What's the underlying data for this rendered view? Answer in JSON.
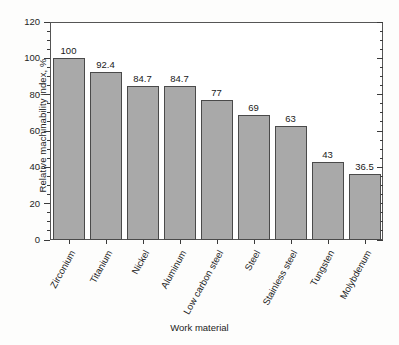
{
  "chart_data": {
    "type": "bar",
    "title": "",
    "xlabel": "Work material",
    "ylabel": "Relative machinability index, %",
    "categories": [
      "Zirconium",
      "Titanium",
      "Nickel",
      "Aluminum",
      "Low carbon steel",
      "Steel",
      "Stainless steel",
      "Tungsten",
      "Molybdenum"
    ],
    "values": [
      100,
      92.4,
      84.7,
      84.7,
      77,
      69,
      63,
      43,
      36.5
    ],
    "value_labels": [
      "100",
      "92.4",
      "84.7",
      "84.7",
      "77",
      "69",
      "63",
      "43",
      "36.5"
    ],
    "ylim": [
      0,
      120
    ],
    "ytick_values": [
      0,
      20,
      40,
      60,
      80,
      100,
      120
    ],
    "ytick_labels": [
      "0",
      "20",
      "40",
      "60",
      "80",
      "100",
      "120"
    ],
    "yminor_step": 5,
    "grid": false,
    "legend": null,
    "bar_color": "#a9a9a9",
    "bar_edge_color": "#4a4a4a",
    "axis_color": "#555555",
    "background": "#ffffff",
    "xtick_label_rotation": -61
  }
}
